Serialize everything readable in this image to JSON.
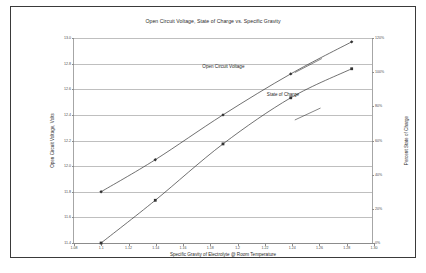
{
  "chart_data": {
    "type": "line",
    "title": "Open Circuit Voltage, State of Charge vs. Specific Gravity",
    "xlabel": "Specific Gravity of Electrolyte @ Room Temperature",
    "ylabel": "Open Circuit Voltage, Volts",
    "ylabel_right": "Percent State of Charge",
    "xlim": [
      1.08,
      1.3
    ],
    "ylim": [
      11.4,
      13.0
    ],
    "ylim_right": [
      0,
      120
    ],
    "xticks": [
      "1.08",
      "1.1",
      "1.12",
      "1.14",
      "1.16",
      "1.18",
      "1.2",
      "1.22",
      "1.24",
      "1.26",
      "1.28",
      "1.30"
    ],
    "xtick_values": [
      1.08,
      1.1,
      1.12,
      1.14,
      1.16,
      1.18,
      1.2,
      1.22,
      1.24,
      1.26,
      1.28,
      1.3
    ],
    "yticks": [
      "13.0",
      "12.8",
      "12.6",
      "12.4",
      "12.2",
      "12.0",
      "11.8",
      "11.6",
      "11.4"
    ],
    "ytick_values": [
      13.0,
      12.8,
      12.6,
      12.4,
      12.2,
      12.0,
      11.8,
      11.6,
      11.4
    ],
    "yticks_right": [
      "120%",
      "100%",
      "80%",
      "60%",
      "40%",
      "20%",
      "0%"
    ],
    "ytick_right_values": [
      120,
      100,
      80,
      60,
      40,
      20,
      0
    ],
    "grid": true,
    "legend_position": "inline-annotations",
    "series": [
      {
        "name": "Open Circuit Voltage",
        "axis": "left",
        "marker": "diamond",
        "x": [
          1.1,
          1.14,
          1.19,
          1.24,
          1.285
        ],
        "values": [
          11.8,
          12.05,
          12.4,
          12.72,
          12.97
        ]
      },
      {
        "name": "State of Charge",
        "axis": "right",
        "marker": "square",
        "x": [
          1.1,
          1.14,
          1.19,
          1.24,
          1.285
        ],
        "values": [
          0,
          25,
          58,
          85,
          102
        ]
      }
    ],
    "annotations": [
      {
        "text": "Open Circuit Voltage",
        "x": 1.205,
        "y": 12.78
      },
      {
        "text": "State of Charge",
        "x": 1.245,
        "y": 12.56
      }
    ]
  }
}
